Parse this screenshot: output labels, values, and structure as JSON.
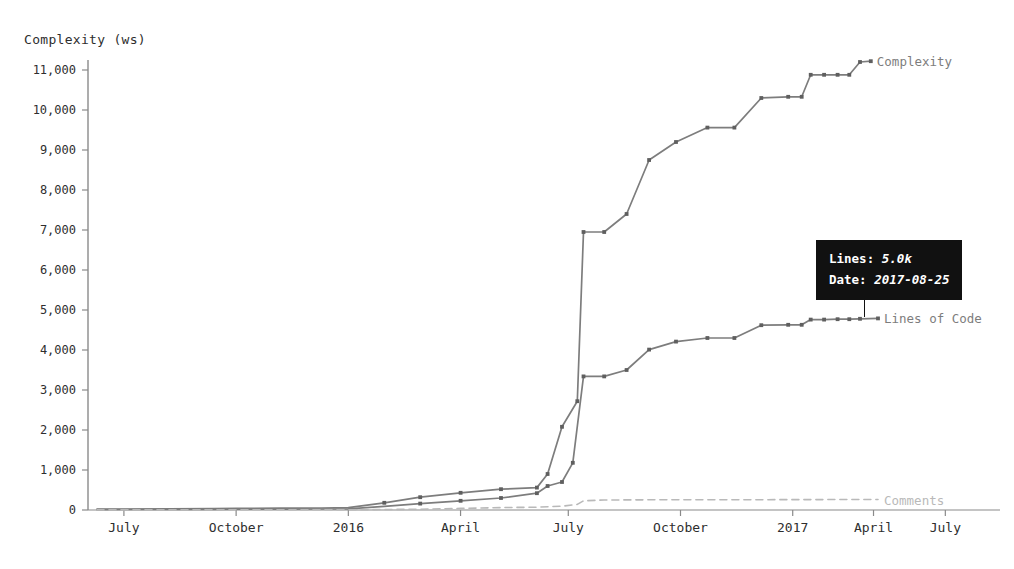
{
  "chart_data": {
    "type": "line",
    "title": "",
    "ylabel": "Complexity (ws)",
    "xlabel": "",
    "ylim": [
      0,
      11500
    ],
    "yticks": [
      0,
      1000,
      2000,
      3000,
      4000,
      5000,
      6000,
      7000,
      8000,
      9000,
      10000,
      11000
    ],
    "ytick_labels": [
      "0",
      "1,000",
      "2,000",
      "3,000",
      "4,000",
      "5,000",
      "6,000",
      "7,000",
      "8,000",
      "9,000",
      "10,000",
      "11,000"
    ],
    "xtick_labels": [
      "July",
      "October",
      "2016",
      "April",
      "July",
      "October",
      "2017",
      "April",
      "July"
    ],
    "xtick_positions": [
      0.04,
      0.165,
      0.29,
      0.415,
      0.535,
      0.66,
      0.785,
      0.875,
      0.955
    ],
    "grid": false,
    "legend": "inline-right",
    "series": [
      {
        "name": "Complexity",
        "color": "#7d7d7d",
        "style": "solid",
        "points": [
          [
            0.01,
            20
          ],
          [
            0.04,
            25
          ],
          [
            0.09,
            30
          ],
          [
            0.14,
            35
          ],
          [
            0.165,
            40
          ],
          [
            0.215,
            45
          ],
          [
            0.26,
            50
          ],
          [
            0.29,
            60
          ],
          [
            0.33,
            180
          ],
          [
            0.37,
            320
          ],
          [
            0.415,
            430
          ],
          [
            0.46,
            520
          ],
          [
            0.5,
            560
          ],
          [
            0.512,
            900
          ],
          [
            0.528,
            2080
          ],
          [
            0.545,
            2720
          ],
          [
            0.552,
            6950
          ],
          [
            0.575,
            6950
          ],
          [
            0.6,
            7400
          ],
          [
            0.625,
            8750
          ],
          [
            0.655,
            9200
          ],
          [
            0.69,
            9560
          ],
          [
            0.72,
            9560
          ],
          [
            0.75,
            10300
          ],
          [
            0.78,
            10330
          ],
          [
            0.795,
            10330
          ],
          [
            0.805,
            10880
          ],
          [
            0.82,
            10880
          ],
          [
            0.835,
            10880
          ],
          [
            0.848,
            10880
          ],
          [
            0.86,
            11200
          ],
          [
            0.872,
            11220
          ]
        ]
      },
      {
        "name": "Lines of Code",
        "color": "#7d7d7d",
        "style": "solid",
        "points": [
          [
            0.01,
            10
          ],
          [
            0.04,
            12
          ],
          [
            0.09,
            15
          ],
          [
            0.14,
            18
          ],
          [
            0.165,
            20
          ],
          [
            0.215,
            22
          ],
          [
            0.26,
            25
          ],
          [
            0.29,
            30
          ],
          [
            0.33,
            90
          ],
          [
            0.37,
            160
          ],
          [
            0.415,
            230
          ],
          [
            0.46,
            300
          ],
          [
            0.5,
            420
          ],
          [
            0.512,
            600
          ],
          [
            0.528,
            700
          ],
          [
            0.54,
            1180
          ],
          [
            0.552,
            3340
          ],
          [
            0.575,
            3340
          ],
          [
            0.6,
            3500
          ],
          [
            0.625,
            4010
          ],
          [
            0.655,
            4210
          ],
          [
            0.69,
            4300
          ],
          [
            0.72,
            4300
          ],
          [
            0.75,
            4620
          ],
          [
            0.78,
            4630
          ],
          [
            0.795,
            4630
          ],
          [
            0.805,
            4760
          ],
          [
            0.82,
            4760
          ],
          [
            0.835,
            4770
          ],
          [
            0.848,
            4770
          ],
          [
            0.86,
            4780
          ],
          [
            0.88,
            4790
          ]
        ]
      },
      {
        "name": "Comments",
        "color": "#b9b9b9",
        "style": "dashed",
        "points": [
          [
            0.01,
            2
          ],
          [
            0.09,
            3
          ],
          [
            0.165,
            4
          ],
          [
            0.26,
            5
          ],
          [
            0.29,
            6
          ],
          [
            0.37,
            20
          ],
          [
            0.415,
            40
          ],
          [
            0.46,
            60
          ],
          [
            0.5,
            70
          ],
          [
            0.528,
            95
          ],
          [
            0.545,
            140
          ],
          [
            0.552,
            230
          ],
          [
            0.575,
            250
          ],
          [
            0.625,
            255
          ],
          [
            0.69,
            258
          ],
          [
            0.75,
            258
          ],
          [
            0.805,
            260
          ],
          [
            0.86,
            262
          ],
          [
            0.88,
            262
          ]
        ]
      }
    ],
    "series_labels": [
      {
        "name": "Complexity",
        "value": 11220,
        "x": 0.872
      },
      {
        "name": "Lines of Code",
        "value": 4790,
        "x": 0.88
      },
      {
        "name": "Comments",
        "value": 262,
        "x": 0.88
      }
    ]
  },
  "tooltip": {
    "lines_key": "Lines:",
    "lines_value": "5.0k",
    "date_key": "Date:",
    "date_value": "2017-08-25"
  }
}
